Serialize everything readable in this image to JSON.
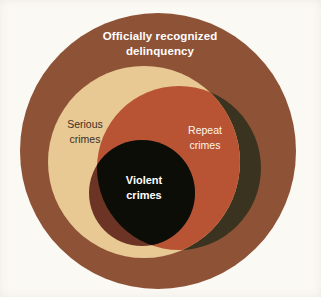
{
  "figure": {
    "type": "venn-diagram",
    "background_color": "#fbf9f4",
    "width": 321,
    "height": 297
  },
  "sets": {
    "outer": {
      "label_line1": "Officially recognized",
      "label_line2": "delinquency",
      "fill_color": "#8e5236",
      "text_color": "#ffffff",
      "cx": 158,
      "cy": 151,
      "r": 138
    },
    "serious": {
      "label_line1": "Serious",
      "label_line2": "crimes",
      "fill_color": "#e8c893",
      "text_color": "#3b3026",
      "cx": 144,
      "cy": 162,
      "r": 96
    },
    "repeat": {
      "label_line1": "Repeat",
      "label_line2": "crimes",
      "fill_color": "#b85434",
      "outside_fill_color": "#3a3320",
      "text_color": "#fdf4ec",
      "cx": 179,
      "cy": 168,
      "r": 82
    },
    "violent": {
      "label_line1": "Violent",
      "label_line2": "crimes",
      "fill_color": "#6b3424",
      "overlap_fill_color": "#0d0d08",
      "text_color": "#ffffff",
      "cx": 142,
      "cy": 193,
      "r": 53
    }
  }
}
